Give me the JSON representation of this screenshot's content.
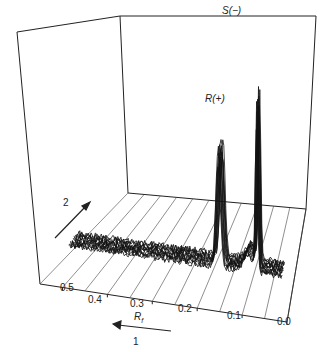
{
  "chart_data": {
    "type": "line",
    "subtype": "3d-stacked-chromatogram",
    "title": "",
    "xlabel": "R_f",
    "x_ticks": [
      "0.5",
      "0.4",
      "0.3",
      "0.2",
      "0.1",
      "0.0"
    ],
    "xlim": [
      0.5,
      0.0
    ],
    "axis_arrows": [
      {
        "label": "1",
        "direction": "left (increasing R_f)"
      },
      {
        "label": "2",
        "direction": "into depth (second dimension)"
      }
    ],
    "annotations": [
      {
        "text": "R(+)",
        "x": 0.17,
        "note": "peak of R enantiomer"
      },
      {
        "text": "S(−)",
        "x": 0.08,
        "note": "tallest peak, S enantiomer"
      }
    ],
    "series_count": 12,
    "peaks": [
      {
        "name": "R(+)",
        "rf": 0.17,
        "relative_height": 0.55
      },
      {
        "name": "S(−)",
        "rf": 0.08,
        "relative_height": 1.0
      },
      {
        "name": "shoulder",
        "rf": 0.1,
        "relative_height": 0.12
      }
    ],
    "grid": true,
    "legend": null
  },
  "labels": {
    "peak_r": "R(+)",
    "peak_s": "S(−)",
    "axis_rf": "R",
    "axis_rf_sub": "f",
    "arrow_1": "1",
    "arrow_2": "2",
    "ticks": [
      "0.5",
      "0.4",
      "0.3",
      "0.2",
      "0.1",
      "0.0"
    ]
  }
}
